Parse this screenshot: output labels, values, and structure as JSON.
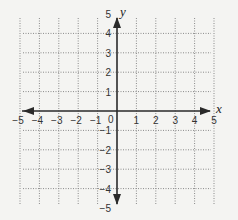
{
  "chart_data": {
    "type": "scatter",
    "title": "",
    "xlabel": "x",
    "ylabel": "y",
    "xlim": [
      -5,
      5
    ],
    "ylim": [
      -5,
      5
    ],
    "grid": true,
    "grid_style": "dotted",
    "origin_label": "0",
    "x_ticks": [
      -5,
      -4,
      -3,
      -2,
      -1,
      1,
      2,
      3,
      4,
      5
    ],
    "x_tick_labels": [
      "−5",
      "−4",
      "−3",
      "−2",
      "−1",
      "1",
      "2",
      "3",
      "4",
      "5"
    ],
    "y_ticks": [
      5,
      4,
      3,
      2,
      1,
      -1,
      -2,
      -3,
      -4,
      -5
    ],
    "y_tick_labels": [
      "5",
      "4",
      "3",
      "2",
      "1",
      "−1",
      "−2",
      "−3",
      "−4",
      "−5"
    ],
    "points": [],
    "legend": null
  },
  "colors": {
    "background": "#f4f4f2",
    "axis": "#2a2a2a",
    "grid": "#8a8a8a",
    "text": "#333333"
  }
}
